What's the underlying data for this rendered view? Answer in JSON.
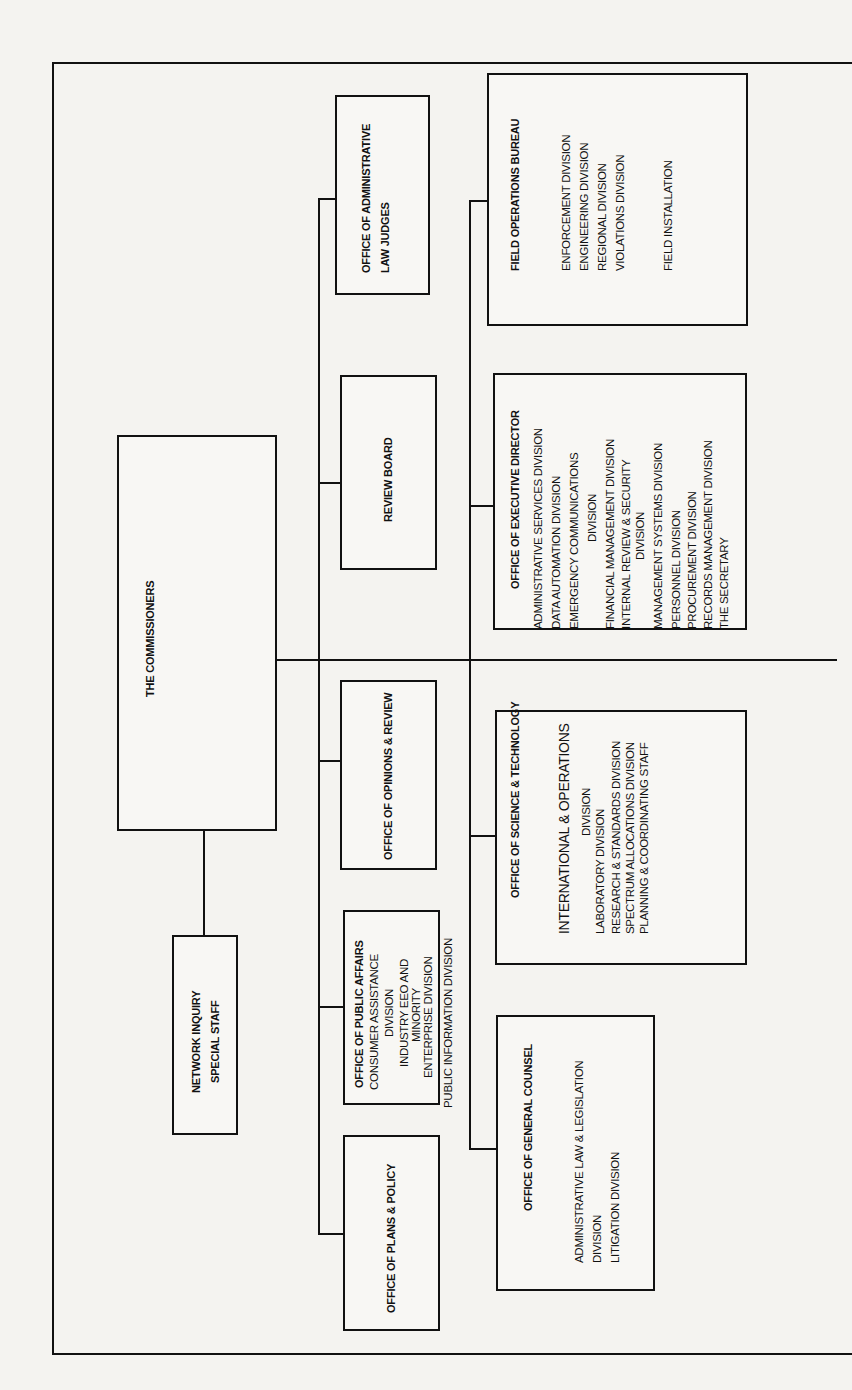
{
  "chart": {
    "orientation": "rotated-90-ccw",
    "root": {
      "label": "THE COMMISSIONERS"
    },
    "staff": {
      "label_line1": "NETWORK INQUIRY",
      "label_line2": "SPECIAL STAFF"
    },
    "top_row": [
      {
        "label": "OFFICE OF PLANS & POLICY"
      },
      {
        "label": "OFFICE OF PUBLIC AFFAIRS",
        "items": [
          "CONSUMER ASSISTANCE",
          "DIVISION",
          "INDUSTRY EEO AND",
          "MINORITY",
          "ENTERPRISE DIVISION",
          "PUBLIC INFORMATION DIVISION"
        ]
      },
      {
        "label": "OFFICE OF OPINIONS & REVIEW"
      },
      {
        "label": "REVIEW BOARD"
      },
      {
        "label_line1": "OFFICE OF ADMINISTRATIVE",
        "label_line2": "LAW JUDGES"
      }
    ],
    "bottom_row": [
      {
        "label": "OFFICE OF GENERAL COUNSEL",
        "items": [
          "ADMINISTRATIVE LAW & LEGISLATION",
          "DIVISION",
          "LITIGATION DIVISION"
        ]
      },
      {
        "label": "OFFICE OF SCIENCE & TECHNOLOGY",
        "items": [
          "INTERNATIONAL & OPERATIONS",
          "DIVISION",
          "LABORATORY DIVISION",
          "RESEARCH & STANDARDS DIVISION",
          "SPECTRUM ALLOCATIONS DIVISION",
          "PLANNING & COORDINATING STAFF"
        ]
      },
      {
        "label": "OFFICE OF EXECUTIVE DIRECTOR",
        "items": [
          "ADMINISTRATIVE SERVICES DIVISION",
          "DATA AUTOMATION DIVISION",
          "EMERGENCY COMMUNICATIONS",
          "DIVISION",
          "FINANCIAL MANAGEMENT DIVISION",
          "INTERNAL REVIEW & SECURITY",
          "DIVISION",
          "MANAGEMENT SYSTEMS DIVISION",
          "PERSONNEL DIVISION",
          "PROCUREMENT DIVISION",
          "RECORDS MANAGEMENT DIVISION",
          "THE SECRETARY"
        ]
      },
      {
        "label": "FIELD OPERATIONS BUREAU",
        "items": [
          "ENFORCEMENT DIVISION",
          "ENGINEERING DIVISION",
          "REGIONAL DIVISION",
          "VIOLATIONS DIVISION",
          "FIELD INSTALLATION"
        ]
      }
    ]
  }
}
